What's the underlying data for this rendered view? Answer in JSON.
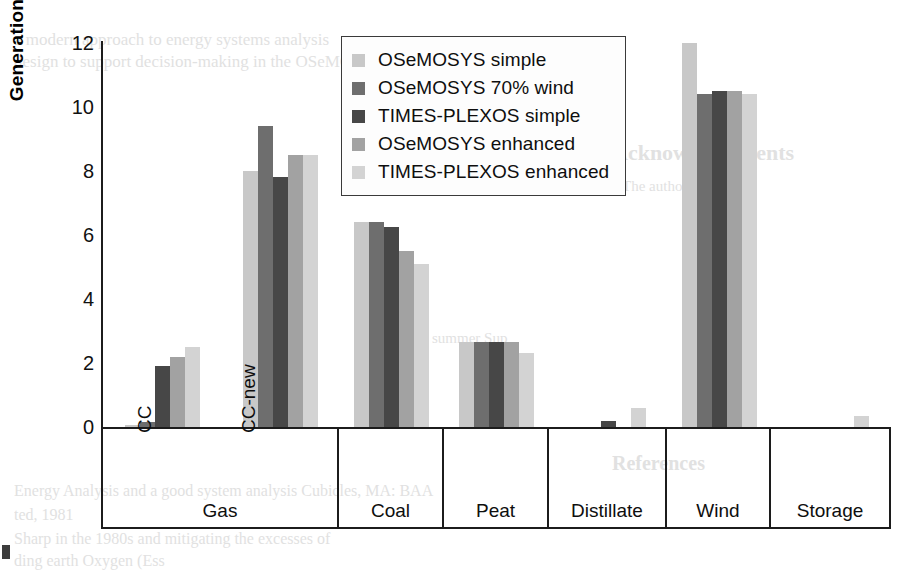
{
  "chart_data": {
    "type": "bar",
    "title": "",
    "xlabel": "",
    "ylabel": "Generation (TWh)",
    "ylim": [
      0,
      12
    ],
    "yticks": [
      0,
      2,
      4,
      6,
      8,
      10,
      12
    ],
    "grid": false,
    "legend_position": "top-center",
    "categories": [
      "CC",
      "CC-new",
      "Coal",
      "Peat",
      "Distillate",
      "Wind",
      "Storage"
    ],
    "category_groups": [
      {
        "label": "Gas",
        "subcategories": [
          "CC",
          "CC-new"
        ]
      },
      {
        "label": "Coal",
        "subcategories": []
      },
      {
        "label": "Peat",
        "subcategories": []
      },
      {
        "label": "Distillate",
        "subcategories": []
      },
      {
        "label": "Wind",
        "subcategories": []
      },
      {
        "label": "Storage",
        "subcategories": []
      }
    ],
    "series": [
      {
        "name": "OSeMOSYS simple",
        "color": "#c8c8c8",
        "values": [
          0.05,
          8.0,
          6.4,
          2.65,
          0.0,
          12.0,
          0.0
        ]
      },
      {
        "name": "OSeMOSYS 70% wind",
        "color": "#6e6e6e",
        "values": [
          0.15,
          9.4,
          6.4,
          2.65,
          0.0,
          10.4,
          0.0
        ]
      },
      {
        "name": "TIMES-PLEXOS simple",
        "color": "#474747",
        "values": [
          1.9,
          7.8,
          6.25,
          2.65,
          0.2,
          10.5,
          0.0
        ]
      },
      {
        "name": "OSeMOSYS enhanced",
        "color": "#a2a2a2",
        "values": [
          2.2,
          8.5,
          5.5,
          2.65,
          0.0,
          10.5,
          0.0
        ]
      },
      {
        "name": "TIMES-PLEXOS enhanced",
        "color": "#d3d3d3",
        "values": [
          2.5,
          8.5,
          5.1,
          2.3,
          0.6,
          10.4,
          0.35
        ]
      }
    ]
  },
  "legend": {
    "items": [
      {
        "label": "OSeMOSYS simple",
        "color": "#c8c8c8"
      },
      {
        "label": "OSeMOSYS 70% wind",
        "color": "#6e6e6e"
      },
      {
        "label": "TIMES-PLEXOS simple",
        "color": "#474747"
      },
      {
        "label": "OSeMOSYS enhanced",
        "color": "#a2a2a2"
      },
      {
        "label": "TIMES-PLEXOS enhanced",
        "color": "#d3d3d3"
      }
    ]
  },
  "axis": {
    "y_title": "Generation (TWh)",
    "y_ticks": [
      "12",
      "10",
      "8",
      "6",
      "4",
      "2",
      "0"
    ]
  },
  "xaxis": {
    "sub_cc": "CC",
    "sub_ccnew": "CC-new",
    "groups": [
      "Gas",
      "Coal",
      "Peat",
      "Distillate",
      "Wind",
      "Storage"
    ]
  },
  "page_bleed": {
    "lines": [
      "a modern approach to energy systems analysis",
      "design to support decision-making in the OSeMOSYS",
      "Acknowledgements",
      "The authors thank",
      "summer Sup",
      "References",
      "Energy Analysis and a good system analysis Cubicles, MA: BAA",
      "ted, 1981",
      "Sharp in the 1980s and mitigating the excesses of",
      "ding earth Oxygen (Ess"
    ]
  }
}
